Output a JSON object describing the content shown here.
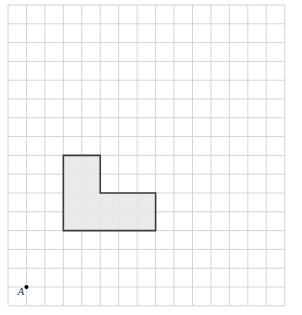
{
  "grid": {
    "cols": 15,
    "rows": 16,
    "origin_x": 8,
    "origin_y": 5,
    "cell_w": 18.45,
    "cell_h": 18.8,
    "line_color": "#d4d4d4"
  },
  "shape": {
    "name": "L-shape",
    "vertices_grid": [
      [
        3,
        8
      ],
      [
        5,
        8
      ],
      [
        5,
        10
      ],
      [
        8,
        10
      ],
      [
        8,
        12
      ],
      [
        3,
        12
      ]
    ],
    "fill": "#e6e6e6",
    "stroke": "#3a3a3a"
  },
  "point": {
    "label": "A",
    "grid": [
      1,
      15
    ],
    "color": "#000000"
  }
}
